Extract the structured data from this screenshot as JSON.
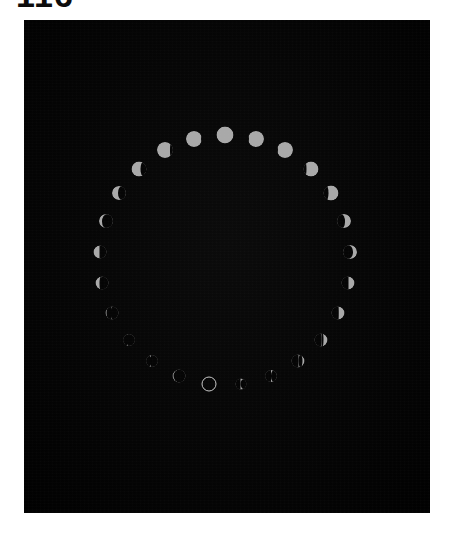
{
  "figure": {
    "number": "116",
    "number_clipped": true
  },
  "plate": {
    "background_color": "#050505",
    "page_background_color": "#ffffff",
    "x": 24,
    "y": 20,
    "width": 406,
    "height": 493,
    "caption": ""
  },
  "chart_data": {
    "type": "scatter",
    "title": "",
    "subtitle": "",
    "xlabel": "",
    "ylabel": "",
    "grid": false,
    "legend_position": "none",
    "layout": {
      "arrangement": "circle",
      "center_x": 201,
      "center_y": 240,
      "radius": 125,
      "count": 25,
      "direction": "clockwise",
      "full_moon_at": "top",
      "new_moon_at": "bottom"
    },
    "colors": {
      "moon_lit": "#a9a9a9",
      "moon_shadow": "#050505",
      "new_moon_outline": "#c9c9c9",
      "sky": "#050505"
    },
    "categories": [
      "Full Moon",
      "Waning Gibbous 96%",
      "Waning Gibbous 90%",
      "Waning Gibbous 80%",
      "Waning Gibbous 70%",
      "Waning Gibbous 62%",
      "Last Quarter 50%",
      "Waning Crescent 38%",
      "Waning Crescent 28%",
      "Waning Crescent 18%",
      "Waning Crescent 10%",
      "Waning Crescent 4%",
      "New Moon 0%",
      "Waxing Crescent 4%",
      "Waxing Crescent 10%",
      "Waxing Crescent 20%",
      "Waxing Crescent 30%",
      "Waxing Crescent 40%",
      "First Quarter 50%",
      "Waxing Gibbous 62%",
      "Waxing Gibbous 72%",
      "Waxing Gibbous 82%",
      "Waxing Gibbous 90%",
      "Waxing Gibbous 96%",
      "Waxing Gibbous 99%"
    ],
    "values": [
      100,
      96,
      90,
      80,
      70,
      62,
      50,
      38,
      28,
      18,
      10,
      4,
      0,
      4,
      10,
      20,
      30,
      40,
      50,
      62,
      72,
      82,
      90,
      96,
      99
    ],
    "ylim": [
      0,
      100
    ],
    "series": [
      {
        "name": "Illuminated fraction (%)",
        "values": [
          100,
          96,
          90,
          80,
          70,
          62,
          50,
          38,
          28,
          18,
          10,
          4,
          0,
          4,
          10,
          20,
          30,
          40,
          50,
          62,
          72,
          82,
          90,
          96,
          99
        ]
      }
    ],
    "moons": [
      {
        "label": "Full Moon",
        "angle": 0,
        "illum": 100,
        "lit_side": "full",
        "size": 17
      },
      {
        "label": "Waning Gibbous 96%",
        "angle": -14.4,
        "illum": 96,
        "lit_side": "left",
        "size": 16
      },
      {
        "label": "Waning Gibbous 90%",
        "angle": -28.8,
        "illum": 90,
        "lit_side": "left",
        "size": 16
      },
      {
        "label": "Waning Gibbous 80%",
        "angle": -43.2,
        "illum": 80,
        "lit_side": "left",
        "size": 15
      },
      {
        "label": "Waning Gibbous 70%",
        "angle": -57.6,
        "illum": 70,
        "lit_side": "left",
        "size": 14
      },
      {
        "label": "Waning Gibbous 62%",
        "angle": -72.0,
        "illum": 62,
        "lit_side": "left",
        "size": 14
      },
      {
        "label": "Last Quarter 50%",
        "angle": -86.4,
        "illum": 50,
        "lit_side": "left",
        "size": 13
      },
      {
        "label": "Waning Crescent 38%",
        "angle": -100.8,
        "illum": 38,
        "lit_side": "left",
        "size": 13
      },
      {
        "label": "Waning Crescent 28%",
        "angle": -115.2,
        "illum": 28,
        "lit_side": "left",
        "size": 13
      },
      {
        "label": "Waning Crescent 18%",
        "angle": -129.6,
        "illum": 18,
        "lit_side": "left",
        "size": 12
      },
      {
        "label": "Waning Crescent 10%",
        "angle": -144.0,
        "illum": 10,
        "lit_side": "left",
        "size": 12
      },
      {
        "label": "Waning Crescent 4%",
        "angle": -158.4,
        "illum": 55,
        "lit_side": "left",
        "size": 13
      },
      {
        "label": "New Moon 0%",
        "angle": -172.8,
        "illum": 0,
        "lit_side": "none",
        "size": 15
      },
      {
        "label": "Waxing Crescent 4%",
        "angle": 172.8,
        "illum": 8,
        "lit_side": "right",
        "size": 11
      },
      {
        "label": "Waxing Crescent 10%",
        "angle": 158.4,
        "illum": 22,
        "lit_side": "right",
        "size": 12
      },
      {
        "label": "Waxing Crescent 20%",
        "angle": 144.0,
        "illum": 34,
        "lit_side": "right",
        "size": 13
      },
      {
        "label": "Waxing Crescent 30%",
        "angle": 129.6,
        "illum": 42,
        "lit_side": "right",
        "size": 13
      },
      {
        "label": "Waxing Crescent 40%",
        "angle": 115.2,
        "illum": 46,
        "lit_side": "right",
        "size": 13
      },
      {
        "label": "First Quarter 50%",
        "angle": 100.8,
        "illum": 50,
        "lit_side": "right",
        "size": 13
      },
      {
        "label": "Waxing Gibbous 62%",
        "angle": 86.4,
        "illum": 62,
        "lit_side": "right",
        "size": 14
      },
      {
        "label": "Waxing Gibbous 72%",
        "angle": 72.0,
        "illum": 72,
        "lit_side": "right",
        "size": 14
      },
      {
        "label": "Waxing Gibbous 82%",
        "angle": 57.6,
        "illum": 82,
        "lit_side": "right",
        "size": 15
      },
      {
        "label": "Waxing Gibbous 90%",
        "angle": 43.2,
        "illum": 90,
        "lit_side": "right",
        "size": 15
      },
      {
        "label": "Waxing Gibbous 96%",
        "angle": 28.8,
        "illum": 96,
        "lit_side": "right",
        "size": 16
      },
      {
        "label": "Waxing Gibbous 99%",
        "angle": 14.4,
        "illum": 99,
        "lit_side": "right",
        "size": 16
      }
    ]
  }
}
